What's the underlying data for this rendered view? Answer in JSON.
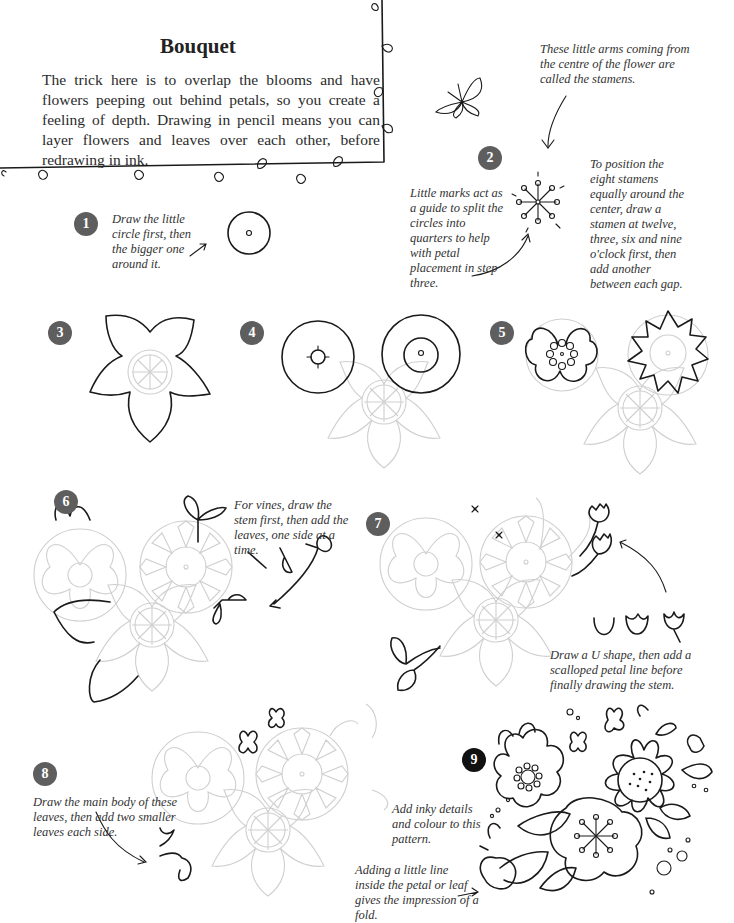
{
  "page": {
    "title": "Bouquet",
    "intro": "The trick here is to overlap the blooms and have flowers peeping out behind petals, so you create a feeling of depth. Drawing in pencil means you can layer flowers and leaves over each other, before redrawing in ink."
  },
  "annotations": {
    "stamens": "These little arms coming from the centre of the flower are called the stamens.",
    "little_marks": "Little marks act as a guide to split the circles into quarters to help with petal placement in step three.",
    "position_stamens": "To position the eight stamens equally around the center, draw a stamen at twelve, three, six and nine o'clock first, then add another between each gap.",
    "vines": "For vines, draw the stem first, then add the leaves, one side at a time.",
    "u_shape": "Draw a U shape, then add a scalloped petal line before finally drawing the stem.",
    "main_body": "Draw the main body of these leaves, then add two smaller leaves each side.",
    "inky": "Add inky details and colour to this pattern.",
    "fold": "Adding a little line inside the petal or leaf gives the impression of a fold."
  },
  "steps": [
    {
      "number": "1",
      "text": "Draw the little circle first, then the bigger one around it."
    },
    {
      "number": "2"
    },
    {
      "number": "3"
    },
    {
      "number": "4"
    },
    {
      "number": "5"
    },
    {
      "number": "6"
    },
    {
      "number": "7"
    },
    {
      "number": "8"
    },
    {
      "number": "9"
    }
  ],
  "colors": {
    "badge": "#5e5e5e",
    "badge_final": "#111111",
    "ink": "#1a1a1a",
    "pencil": "#cfcfcf"
  },
  "icons": [
    "butterfly-illustration",
    "arrow-icon",
    "flower-illustration",
    "leaf-border"
  ]
}
